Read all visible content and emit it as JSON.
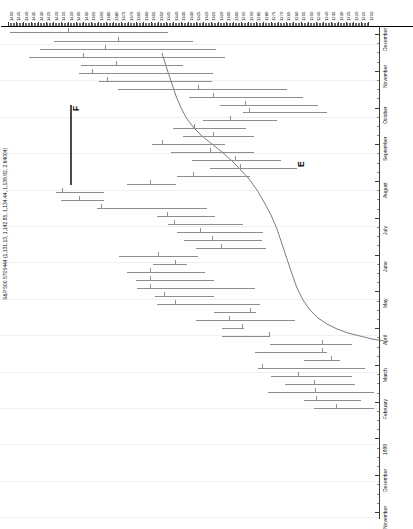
{
  "chart_data": {
    "type": "bar",
    "title": "S&P 500 5705444 (1,131.13, 1,142.85, 1,134.44, 1,139.92, 2.64004)",
    "orientation": "rotated-90",
    "xlabel": "",
    "ylabel": "",
    "grid": true,
    "legend": false,
    "value_axis": {
      "position": "top",
      "direction": "descending-left-to-right",
      "range": [
        1450,
        1210
      ],
      "tick_step": 5,
      "tick_labels": [
        "1450",
        "1445",
        "1440",
        "1435",
        "1430",
        "1425",
        "1420",
        "1415",
        "1410",
        "1405",
        "1400",
        "1395",
        "1390",
        "1385",
        "1380",
        "1375",
        "1370",
        "1365",
        "1360",
        "1355",
        "1350",
        "1345",
        "1340",
        "1335",
        "1330",
        "1325",
        "1320",
        "1315",
        "1310",
        "1305",
        "1300",
        "1295",
        "1290",
        "1285",
        "1280",
        "1275",
        "1270",
        "1265",
        "1260",
        "1255",
        "1250",
        "1245",
        "1240",
        "1235",
        "1230",
        "1225",
        "1220",
        "1215",
        "1210"
      ]
    },
    "date_axis": {
      "position": "right",
      "direction": "top-to-bottom-descending",
      "tick_labels": [
        "December",
        "November",
        "October",
        "September",
        "August",
        "July",
        "June",
        "May",
        "April",
        "March",
        "February",
        "1999",
        "December",
        "November"
      ]
    },
    "annotations": [
      {
        "label": "F",
        "x": 71,
        "y": 85
      },
      {
        "label": "E",
        "x": 296,
        "y": 141
      }
    ],
    "series": [
      {
        "name": "OHLC bars",
        "note": "each entry: [high_px, low_px, tick_px, row_y_px] in plot coordinates",
        "bars": [
          [
            10,
            168,
            68,
            6
          ],
          [
            54,
            193,
            118,
            15
          ],
          [
            40,
            216,
            105,
            23
          ],
          [
            29,
            225,
            83,
            31
          ],
          [
            81,
            183,
            116,
            39
          ],
          [
            79,
            213,
            92,
            47
          ],
          [
            99,
            212,
            107,
            55
          ],
          [
            118,
            287,
            198,
            63
          ],
          [
            189,
            303,
            213,
            71
          ],
          [
            220,
            318,
            245,
            79
          ],
          [
            243,
            327,
            249,
            86
          ],
          [
            203,
            277,
            230,
            94
          ],
          [
            173,
            246,
            194,
            102
          ],
          [
            183,
            254,
            213,
            110
          ],
          [
            152,
            225,
            162,
            118
          ],
          [
            171,
            254,
            210,
            126
          ],
          [
            192,
            281,
            235,
            134
          ],
          [
            210,
            297,
            240,
            142
          ],
          [
            177,
            250,
            193,
            150
          ],
          [
            127,
            176,
            150,
            158
          ],
          [
            56,
            104,
            62,
            166
          ],
          [
            61,
            104,
            79,
            174
          ],
          [
            97,
            207,
            101,
            182
          ],
          [
            157,
            215,
            167,
            190
          ],
          [
            168,
            243,
            174,
            198
          ],
          [
            177,
            263,
            200,
            206
          ],
          [
            184,
            262,
            212,
            214
          ],
          [
            196,
            266,
            221,
            222
          ],
          [
            119,
            198,
            158,
            230
          ],
          [
            153,
            187,
            175,
            238
          ],
          [
            127,
            205,
            150,
            246
          ],
          [
            136,
            214,
            150,
            254
          ],
          [
            137,
            255,
            150,
            262
          ],
          [
            155,
            214,
            164,
            270
          ],
          [
            157,
            260,
            175,
            278
          ],
          [
            214,
            256,
            250,
            286
          ],
          [
            196,
            295,
            229,
            294
          ],
          [
            222,
            244,
            242,
            302
          ],
          [
            222,
            270,
            269,
            310
          ],
          [
            270,
            352,
            322,
            318
          ],
          [
            255,
            327,
            322,
            326
          ],
          [
            304,
            340,
            331,
            334
          ],
          [
            258,
            365,
            262,
            342
          ],
          [
            271,
            352,
            298,
            350
          ],
          [
            285,
            355,
            314,
            358
          ],
          [
            268,
            374,
            315,
            366
          ],
          [
            304,
            361,
            316,
            374
          ],
          [
            314,
            374,
            336,
            382
          ]
        ]
      },
      {
        "name": "trend curve",
        "type": "line",
        "points": [
          [
            162,
            27
          ],
          [
            166,
            40
          ],
          [
            171,
            55
          ],
          [
            176,
            70
          ],
          [
            181,
            82
          ],
          [
            187,
            93
          ],
          [
            194,
            102
          ],
          [
            202,
            110
          ],
          [
            212,
            118
          ],
          [
            222,
            126
          ],
          [
            231,
            134
          ],
          [
            240,
            143
          ],
          [
            249,
            153
          ],
          [
            257,
            164
          ],
          [
            264,
            176
          ],
          [
            271,
            189
          ],
          [
            277,
            203
          ],
          [
            282,
            218
          ],
          [
            287,
            233
          ],
          [
            292,
            248
          ],
          [
            297,
            262
          ],
          [
            303,
            274
          ],
          [
            310,
            284
          ],
          [
            318,
            292
          ],
          [
            327,
            298
          ],
          [
            337,
            303
          ],
          [
            348,
            307
          ],
          [
            360,
            310
          ],
          [
            372,
            313
          ],
          [
            384,
            315
          ]
        ]
      }
    ]
  },
  "marker": {
    "name": "vertical-marker",
    "x": 70,
    "y_top": 79,
    "y_bottom": 159,
    "color": "#4a4a4a"
  },
  "colors": {
    "bar": "#8e8e8e",
    "curve": "#6e6e6e",
    "grid": "#f0f0f2",
    "axis": "#3b3b3b",
    "text": "#111111"
  }
}
